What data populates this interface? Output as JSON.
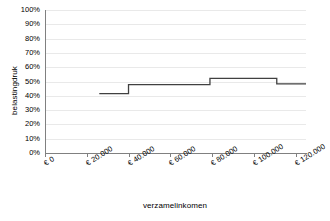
{
  "chart_data": {
    "type": "line",
    "subtype": "step",
    "title": "",
    "xlabel": "verzamelinkomen",
    "ylabel": "belastingdruk",
    "xlim": [
      0,
      125000
    ],
    "ylim": [
      0,
      1.0
    ],
    "grid": true,
    "legend": null,
    "x_ticks": [
      0,
      20000,
      40000,
      60000,
      80000,
      100000,
      120000
    ],
    "x_tick_labels": [
      "€ 0",
      "€ 20.000",
      "€ 40.000",
      "€ 60.000",
      "€ 80.000",
      "€ 100.000",
      "€ 120.000"
    ],
    "y_ticks": [
      0,
      0.1,
      0.2,
      0.3,
      0.4,
      0.5,
      0.6,
      0.7,
      0.8,
      0.9,
      1.0
    ],
    "y_tick_labels": [
      "0%",
      "10%",
      "20%",
      "30%",
      "40%",
      "50%",
      "60%",
      "70%",
      "80%",
      "90%",
      "100%"
    ],
    "series": [
      {
        "name": "belastingdruk",
        "color": "#404040",
        "steps": [
          {
            "x_start": 26000,
            "x_end": 40000,
            "value": 0.415
          },
          {
            "x_start": 40000,
            "x_end": 79000,
            "value": 0.478
          },
          {
            "x_start": 79000,
            "x_end": 111000,
            "value": 0.522
          },
          {
            "x_start": 111000,
            "x_end": 125000,
            "value": 0.483
          }
        ],
        "x": [
          26000,
          40000,
          40000,
          79000,
          79000,
          111000,
          111000,
          125000
        ],
        "y": [
          0.415,
          0.415,
          0.478,
          0.478,
          0.522,
          0.522,
          0.483,
          0.483
        ]
      }
    ]
  }
}
